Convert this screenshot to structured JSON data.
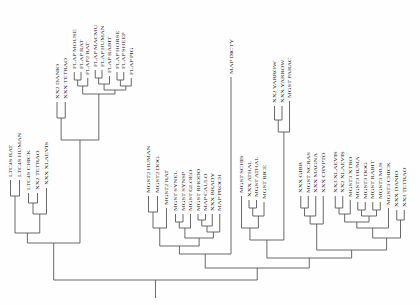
{
  "figure": {
    "type": "phylogenetic-tree",
    "orientation": "vertical-rooted-bottom",
    "header_fragment": "",
    "line_color": "#555555",
    "text_color": "#1a1a1a",
    "background": "#ffffff",
    "root_label": ""
  },
  "tips": [
    {
      "id": "t1",
      "label": "LTC4S RAT",
      "x": 14,
      "y": 180
    },
    {
      "id": "t2",
      "label": "LTC4S HUMAN",
      "x": 26,
      "y": 180
    },
    {
      "id": "t3",
      "label": "LTC4S CHICK",
      "x": 38,
      "y": 193
    },
    {
      "id": "t4",
      "label": "XX2 TETRAO",
      "x": 50,
      "y": 193
    },
    {
      "id": "t5",
      "label": "XXX XLAEVIS",
      "x": 62,
      "y": 188
    },
    {
      "id": "t6",
      "label": "XX2 DANIO",
      "x": 76,
      "y": 102
    },
    {
      "id": "t7",
      "label": "XXX TETRAO",
      "x": 87,
      "y": 102
    },
    {
      "id": "t8",
      "label": "FLAP MOUSE",
      "x": 99,
      "y": 72
    },
    {
      "id": "t9",
      "label": "FLAP RAT",
      "x": 108,
      "y": 72
    },
    {
      "id": "t10",
      "label": "FLAP2 RAT",
      "x": 117,
      "y": 78
    },
    {
      "id": "t11",
      "label": "FLAP MACMU",
      "x": 127,
      "y": 70
    },
    {
      "id": "t12",
      "label": "FLAP HUMAN",
      "x": 136,
      "y": 70
    },
    {
      "id": "t13",
      "label": "FLAP RABIT",
      "x": 146,
      "y": 76
    },
    {
      "id": "t14",
      "label": "FLAP HORSE",
      "x": 156,
      "y": 72
    },
    {
      "id": "t15",
      "label": "FLAP SHEEP",
      "x": 165,
      "y": 72
    },
    {
      "id": "t16",
      "label": "FLAP PIG",
      "x": 175,
      "y": 78
    },
    {
      "id": "t17",
      "label": "MGST2 HUMAN",
      "x": 198,
      "y": 196
    },
    {
      "id": "t18",
      "label": "MGST2 DOG",
      "x": 210,
      "y": 196
    },
    {
      "id": "t19",
      "label": "MGST2 RAT",
      "x": 222,
      "y": 208
    },
    {
      "id": "t20",
      "label": "MGST SYNEL",
      "x": 234,
      "y": 214
    },
    {
      "id": "t21",
      "label": "MGST SYNSP",
      "x": 244,
      "y": 214
    },
    {
      "id": "t22",
      "label": "MGST GLOEO",
      "x": 254,
      "y": 214
    },
    {
      "id": "t23",
      "label": "MGST RHODO",
      "x": 264,
      "y": 214
    },
    {
      "id": "t24",
      "label": "MAP CAULO",
      "x": 274,
      "y": 214
    },
    {
      "id": "t25",
      "label": "XXX BRADY",
      "x": 283,
      "y": 214
    },
    {
      "id": "t26",
      "label": "MAP PROCH",
      "x": 293,
      "y": 214
    },
    {
      "id": "t27",
      "label": "MAP DICTY",
      "x": 308,
      "y": 77
    },
    {
      "id": "t28",
      "label": "MGST SCHIS",
      "x": 322,
      "y": 196
    },
    {
      "id": "t29",
      "label": "XXX ATHAL",
      "x": 332,
      "y": 200
    },
    {
      "id": "t30",
      "label": "MGST ATHAL",
      "x": 342,
      "y": 200
    },
    {
      "id": "t31",
      "label": "MGST RICE",
      "x": 352,
      "y": 202
    },
    {
      "id": "t32",
      "label": "XX2 YARROW",
      "x": 366,
      "y": 106
    },
    {
      "id": "t33",
      "label": "XXX YARROW",
      "x": 376,
      "y": 106
    },
    {
      "id": "t34",
      "label": "MGST PARAC",
      "x": 386,
      "y": 101
    },
    {
      "id": "t35",
      "label": "XXX GIBB",
      "x": 401,
      "y": 196
    },
    {
      "id": "t36",
      "label": "MGST NCRAS",
      "x": 411,
      "y": 196
    },
    {
      "id": "t37",
      "label": "XXX MAGNA",
      "x": 421,
      "y": 196
    },
    {
      "id": "t38",
      "label": "XXX CRYPTO",
      "x": 431,
      "y": 196
    },
    {
      "id": "t39",
      "label": "XX3 XLAEVIS",
      "x": 447,
      "y": 196
    },
    {
      "id": "t40",
      "label": "XX2 XLAEVIS",
      "x": 457,
      "y": 196
    },
    {
      "id": "t41",
      "label": "MGST3 XTRO",
      "x": 467,
      "y": 200
    },
    {
      "id": "t42",
      "label": "MGST3 HUMA",
      "x": 477,
      "y": 202
    },
    {
      "id": "t43",
      "label": "MGST3 DOG",
      "x": 487,
      "y": 202
    },
    {
      "id": "t44",
      "label": "MGST RABIT",
      "x": 497,
      "y": 202
    },
    {
      "id": "t45",
      "label": "MGST3 MUS",
      "x": 507,
      "y": 202
    },
    {
      "id": "t46",
      "label": "MGST3 CHICK",
      "x": 518,
      "y": 208
    },
    {
      "id": "t47",
      "label": "XXX DANIO",
      "x": 529,
      "y": 210
    },
    {
      "id": "t48",
      "label": "XX3 TETRAO",
      "x": 539,
      "y": 210
    }
  ],
  "clades": [
    {
      "id": "c_ltc4s_mamm",
      "children": [
        "t1",
        "t2"
      ],
      "y": 196
    },
    {
      "id": "c_ltc4s_bird",
      "children": [
        "t3",
        "t4"
      ],
      "y": 203
    },
    {
      "id": "c_ltc4s_tetr",
      "children": [
        "c_ltc4s_bird",
        "t5"
      ],
      "y": 214
    },
    {
      "id": "c_ltc4s",
      "children": [
        "c_ltc4s_mamm",
        "c_ltc4s_tetr"
      ],
      "y": 233
    },
    {
      "id": "c_fish",
      "children": [
        "t6",
        "t7"
      ],
      "y": 118
    },
    {
      "id": "c_rodent",
      "children": [
        "t8",
        "t9"
      ],
      "y": 80
    },
    {
      "id": "c_rodent2",
      "children": [
        "c_rodent",
        "t10"
      ],
      "y": 86
    },
    {
      "id": "c_primate",
      "children": [
        "t11",
        "t12"
      ],
      "y": 78
    },
    {
      "id": "c_prim_rab",
      "children": [
        "c_primate",
        "t13"
      ],
      "y": 84
    },
    {
      "id": "c_ungul_a",
      "children": [
        "t14",
        "t15"
      ],
      "y": 80
    },
    {
      "id": "c_ungul",
      "children": [
        "c_ungul_a",
        "t16"
      ],
      "y": 86
    },
    {
      "id": "c_mamm_flap",
      "children": [
        "c_prim_rab",
        "c_ungul"
      ],
      "y": 90
    },
    {
      "id": "c_flap",
      "children": [
        "c_rodent2",
        "c_mamm_flap"
      ],
      "y": 94
    },
    {
      "id": "c_flap_fish",
      "children": [
        "c_fish",
        "c_flap"
      ],
      "y": 140
    },
    {
      "id": "c_ltc_flap",
      "children": [
        "c_ltc4s",
        "c_flap_fish"
      ],
      "y": 243
    },
    {
      "id": "c_mgst2_a",
      "children": [
        "t17",
        "t18"
      ],
      "y": 212
    },
    {
      "id": "c_mgst2",
      "children": [
        "c_mgst2_a",
        "t19"
      ],
      "y": 228
    },
    {
      "id": "c_cyano_a",
      "children": [
        "t20",
        "t21"
      ],
      "y": 222
    },
    {
      "id": "c_cyano",
      "children": [
        "c_cyano_a",
        "t22"
      ],
      "y": 228
    },
    {
      "id": "c_bact_a",
      "children": [
        "t23",
        "t24"
      ],
      "y": 220
    },
    {
      "id": "c_bact_b",
      "children": [
        "c_bact_a",
        "t25"
      ],
      "y": 226
    },
    {
      "id": "c_bact",
      "children": [
        "c_bact_b",
        "t26"
      ],
      "y": 232
    },
    {
      "id": "c_prok",
      "children": [
        "c_cyano",
        "c_bact"
      ],
      "y": 238
    },
    {
      "id": "c_mgst2_prok",
      "children": [
        "c_mgst2",
        "c_prok"
      ],
      "y": 246
    },
    {
      "id": "c_mgst2_dict",
      "children": [
        "c_mgst2_prok",
        "t27"
      ],
      "y": 254
    },
    {
      "id": "c_plant_a",
      "children": [
        "t29",
        "t30"
      ],
      "y": 208
    },
    {
      "id": "c_plant_b",
      "children": [
        "c_plant_a",
        "t31"
      ],
      "y": 216
    },
    {
      "id": "c_plant",
      "children": [
        "t28",
        "c_plant_b"
      ],
      "y": 228
    },
    {
      "id": "c_yeast",
      "children": [
        "t32",
        "t33"
      ],
      "y": 120
    },
    {
      "id": "c_yeast_par",
      "children": [
        "c_yeast",
        "t34"
      ],
      "y": 132
    },
    {
      "id": "c_plant_y",
      "children": [
        "c_plant",
        "c_yeast_par"
      ],
      "y": 240
    },
    {
      "id": "c_fungi_a",
      "children": [
        "t35",
        "t36"
      ],
      "y": 208
    },
    {
      "id": "c_fungi_b",
      "children": [
        "c_fungi_a",
        "t37"
      ],
      "y": 216
    },
    {
      "id": "c_fungi",
      "children": [
        "c_fungi_b",
        "t38"
      ],
      "y": 224
    },
    {
      "id": "c_xen",
      "children": [
        "t39",
        "t40"
      ],
      "y": 208
    },
    {
      "id": "c_xen_xt",
      "children": [
        "c_xen",
        "t41"
      ],
      "y": 214
    },
    {
      "id": "c_mgst3_hd",
      "children": [
        "t42",
        "t43"
      ],
      "y": 210
    },
    {
      "id": "c_mgst3_rm",
      "children": [
        "t44",
        "t45"
      ],
      "y": 210
    },
    {
      "id": "c_mgst3_mam",
      "children": [
        "c_mgst3_hd",
        "c_mgst3_rm"
      ],
      "y": 216
    },
    {
      "id": "c_mgst3_amn",
      "children": [
        "c_xen_xt",
        "c_mgst3_mam"
      ],
      "y": 222
    },
    {
      "id": "c_mgst3_ch",
      "children": [
        "c_mgst3_amn",
        "t46"
      ],
      "y": 228
    },
    {
      "id": "c_fish3",
      "children": [
        "t47",
        "t48"
      ],
      "y": 220
    },
    {
      "id": "c_mgst3",
      "children": [
        "c_mgst3_ch",
        "c_fish3"
      ],
      "y": 238
    },
    {
      "id": "c_fungi_mgst3",
      "children": [
        "c_fungi",
        "c_mgst3"
      ],
      "y": 250
    },
    {
      "id": "c_right",
      "children": [
        "c_plant_y",
        "c_fungi_mgst3"
      ],
      "y": 258
    },
    {
      "id": "c_big_right",
      "children": [
        "c_mgst2_dict",
        "c_right"
      ],
      "y": 268
    },
    {
      "id": "c_root",
      "children": [
        "c_ltc_flap",
        "c_big_right"
      ],
      "y": 280
    }
  ],
  "root": {
    "id": "c_root",
    "stem_length": 18
  }
}
